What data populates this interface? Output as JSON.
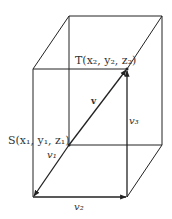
{
  "diagram": {
    "type": "3d-box-vector-decomposition",
    "points": {
      "S": {
        "name": "S",
        "coords": [
          "x1",
          "y1",
          "z1"
        ],
        "label": "S(x₁, y₁, z₁)"
      },
      "T": {
        "name": "T",
        "coords": [
          "x2",
          "y2",
          "z2"
        ],
        "label": "T(x₂, y₂, z₂)"
      }
    },
    "vectors": {
      "v": {
        "label": "v",
        "from": "S",
        "to": "T"
      },
      "v1": {
        "label": "v₁",
        "from": "S",
        "to": "front-bottom-left corner"
      },
      "v2": {
        "label": "v₂",
        "from": "front-bottom-left corner",
        "to": "front-bottom-right corner"
      },
      "v3": {
        "label": "v₃",
        "from": "front-bottom-right corner",
        "to": "T"
      }
    },
    "colors": {
      "line": "#222222",
      "text": "#333333",
      "background": "#ffffff"
    }
  }
}
